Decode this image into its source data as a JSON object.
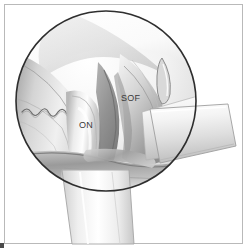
{
  "figure": {
    "frame": {
      "border_color": "#b9b9b9",
      "background": "#ffffff"
    },
    "viewport": {
      "shape": "circle",
      "center_x": 106,
      "center_y": 101,
      "radius": 91,
      "outline_color": "#2e2e2e",
      "fill_light": "#fbfbfb",
      "fill_mid": "#d2d2d2",
      "fill_dark": "#8d8d8d"
    },
    "labels": [
      {
        "id": "on",
        "text": "ON",
        "x": 79,
        "y": 120,
        "color": "#3a3a3a"
      },
      {
        "id": "sof",
        "text": "SOF",
        "x": 121,
        "y": 93,
        "color": "#3a3a3a"
      }
    ],
    "structures": [
      {
        "name": "optic-nerve",
        "abbrev": "ON"
      },
      {
        "name": "superior-orbital-fissure",
        "abbrev": "SOF"
      },
      {
        "name": "vessel-squiggle"
      },
      {
        "name": "orbital-apex-recess"
      }
    ],
    "instruments": [
      {
        "name": "retractor-blade-right",
        "entry": "right-side"
      },
      {
        "name": "retractor-blade-bottom",
        "entry": "bottom"
      }
    ],
    "corner_mark": {
      "color": "#4a4a4a"
    }
  }
}
